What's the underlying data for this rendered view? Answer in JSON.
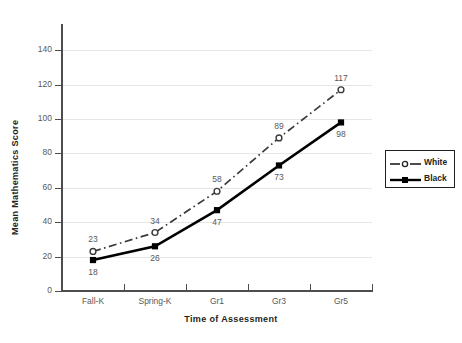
{
  "chart_data": {
    "type": "line",
    "title": "",
    "xlabel": "Time of Assessment",
    "ylabel": "Mean Mathematics Score",
    "categories": [
      "Fall-K",
      "Spring-K",
      "Gr1",
      "Gr3",
      "Gr5"
    ],
    "series": [
      {
        "name": "White",
        "values": [
          23,
          34,
          58,
          89,
          117
        ],
        "line_style": "dash-dot",
        "marker": "open-circle",
        "color": "#3a3a3a",
        "label_position": "above"
      },
      {
        "name": "Black",
        "values": [
          18,
          26,
          47,
          73,
          98
        ],
        "line_style": "solid",
        "marker": "filled-square",
        "color": "#000000",
        "label_position": "below"
      }
    ],
    "ylim": [
      0,
      150
    ],
    "yticks": [
      0,
      20,
      40,
      60,
      80,
      100,
      120,
      140
    ],
    "ytick_labels": [
      "0",
      "20",
      "40",
      "60",
      "80",
      "100",
      "120",
      "140"
    ],
    "grid": "horizontal",
    "gridline_color": "#e6e6e6",
    "legend_position": "right-middle",
    "legend_entries": [
      "White",
      "Black"
    ],
    "axis_color": "#4d4d4d",
    "text_color": "#58595b",
    "background": "#ffffff"
  }
}
